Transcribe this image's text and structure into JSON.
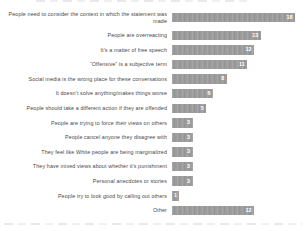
{
  "chart_data": {
    "type": "bar",
    "orientation": "horizontal",
    "title": "",
    "xlabel": "",
    "ylabel": "",
    "xlim": [
      0,
      18
    ],
    "grid": false,
    "legend": null,
    "bar_color": "#9c9c9c",
    "value_label_color": "#ffffff",
    "categories": [
      "People need to consider the context in which the statement was made",
      "People are overreacting",
      "It’s a matter of free speech",
      "“Offensive” is a subjective term",
      "Social media is the wrong place for these conversations",
      "It doesn’t solve anything/makes things worse",
      "People should take a different action if they are offended",
      "People are trying to force their views on others",
      "People cancel anyone they disagree with",
      "They feel like White people are being marginalized",
      "They have mixed views about whether it’s punishment",
      "Personal anecdotes or stories",
      "People try to look good by calling out others",
      "Other"
    ],
    "values": [
      18,
      13,
      12,
      11,
      8,
      6,
      5,
      3,
      3,
      3,
      3,
      3,
      1,
      12
    ]
  }
}
